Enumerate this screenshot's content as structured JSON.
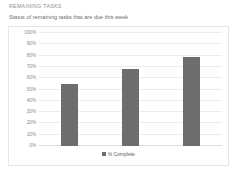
{
  "widget": {
    "title": "REMAINING TASKS",
    "subtitle": "Status of remaining tasks that are due this week"
  },
  "chart_data": {
    "type": "bar",
    "title": "",
    "xlabel": "",
    "ylabel": "",
    "ylim": [
      0,
      100
    ],
    "grid": true,
    "legend_position": "bottom",
    "categories": [
      "",
      "",
      ""
    ],
    "series": [
      {
        "name": "% Complete",
        "color": "#6d6d6d",
        "values": [
          55,
          68,
          79
        ]
      }
    ],
    "ytick_labels": [
      "100%",
      "90%",
      "80%",
      "70%",
      "60%",
      "50%",
      "40%",
      "30%",
      "20%",
      "10%",
      "0%"
    ],
    "ytick_values": [
      100,
      90,
      80,
      70,
      60,
      50,
      40,
      30,
      20,
      10,
      0
    ],
    "legend": [
      {
        "label": "% Complete",
        "color": "#6d6d6d"
      }
    ]
  }
}
